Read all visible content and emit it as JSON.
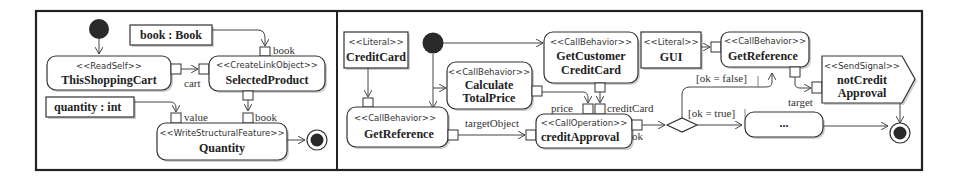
{
  "left_diagram": {
    "nodes": {
      "read_self": {
        "stereotype": "<<ReadSelf>>",
        "name": "ThisShoppingCart"
      },
      "create_link": {
        "stereotype": "<<CreateLinkObject>>",
        "name": "SelectedProduct"
      },
      "write_feature": {
        "stereotype": "<<WriteStructuralFeature>>",
        "name": "Quantity"
      },
      "book_value": {
        "name": "book : Book"
      },
      "quantity_value": {
        "name": "quantity : int"
      }
    },
    "pins": {
      "cart": "cart",
      "book_in": "book",
      "value": "value",
      "book_out": "book"
    }
  },
  "right_diagram": {
    "nodes": {
      "literal_creditcard": {
        "stereotype": "<<Literal>>",
        "name": "CreditCard"
      },
      "get_reference_1": {
        "stereotype": "<<CallBehavior>>",
        "name": "GetReference"
      },
      "calculate_total": {
        "stereotype": "<<CallBehavior>>",
        "name_line1": "Calculate",
        "name_line2": "TotalPrice"
      },
      "get_customer_cc": {
        "stereotype": "<<CallBehavior>>",
        "name_line1": "GetCustomer",
        "name_line2": "CreditCard"
      },
      "literal_gui": {
        "stereotype": "<<Literal>>",
        "name": "GUI"
      },
      "get_reference_2": {
        "stereotype": "<<CallBehavior>>",
        "name": "GetReference"
      },
      "credit_approval": {
        "stereotype": "<<CallOperation>>",
        "name": "creditApproval"
      },
      "not_credit_approval": {
        "stereotype": "<<SendSignal>>",
        "name_line1": "notCredit",
        "name_line2": "Approval"
      },
      "ellipsis_action": {
        "name": "..."
      }
    },
    "pins": {
      "target_object": "targetObject",
      "price": "price",
      "credit_card": "creditCard",
      "ok": "ok",
      "target": "target"
    },
    "guards": {
      "ok_false": "[ok = false]",
      "ok_true": "[ok = true]"
    }
  }
}
